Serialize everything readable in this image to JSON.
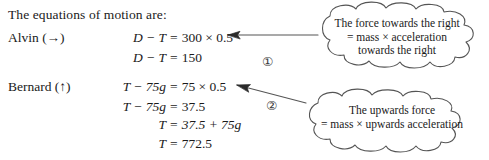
{
  "intro": {
    "text": "The equations of motion are:"
  },
  "rows": [
    {
      "actor": "Alvin (→)",
      "equations": [
        {
          "lhs": "D − T",
          "eq": "=",
          "rhs": "300 × 0.5"
        },
        {
          "lhs": "D − T",
          "eq": "=",
          "rhs": "150"
        }
      ]
    },
    {
      "actor": "Bernard (↑)",
      "equations": [
        {
          "lhs": "T − 75g",
          "eq": "=",
          "rhs": "75 × 0.5"
        },
        {
          "lhs": "T − 75g",
          "eq": "=",
          "rhs": "37.5"
        },
        {
          "lhs": "T",
          "eq": "=",
          "rhs": "37.5 + 75g"
        },
        {
          "lhs": "T",
          "eq": "=",
          "rhs": "772.5"
        }
      ]
    }
  ],
  "markers": [
    {
      "label": "①"
    },
    {
      "label": "②"
    }
  ],
  "callouts": [
    {
      "lines": [
        "The force towards the right",
        "= mass × acceleration",
        "towards the right"
      ]
    },
    {
      "lines": [
        "The upwards force",
        "= mass × upwards acceleration"
      ]
    }
  ],
  "colors": {
    "ink": "#1a1a1a",
    "stroke": "#555555",
    "background": "#ffffff"
  }
}
